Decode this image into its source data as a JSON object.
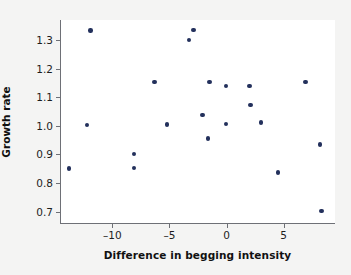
{
  "chart_data": {
    "type": "scatter",
    "title": "",
    "xlabel": "Difference in begging intensity",
    "ylabel": "Growth rate",
    "xlim": [
      -14.5,
      9.5
    ],
    "ylim": [
      0.66,
      1.37
    ],
    "xticks": [
      -10,
      -5,
      0,
      5
    ],
    "xtick_labels": [
      "–10",
      "–5",
      "0",
      "5"
    ],
    "yticks": [
      0.7,
      0.8,
      0.9,
      1.0,
      1.1,
      1.2,
      1.3
    ],
    "ytick_labels": [
      "0.7",
      "0.8",
      "0.9",
      "1.0",
      "1.1",
      "1.2",
      "1.3"
    ],
    "grid": false,
    "legend": null,
    "marker_color": "#23305c",
    "axis_color": "#6e7076",
    "background": "#ffffff",
    "page_background": "#f4f4f3",
    "points": [
      {
        "x": -13.8,
        "y": 0.85
      },
      {
        "x": -11.9,
        "y": 1.333
      },
      {
        "x": -12.2,
        "y": 1.003
      },
      {
        "x": -8.1,
        "y": 0.901
      },
      {
        "x": -8.1,
        "y": 0.853
      },
      {
        "x": -6.3,
        "y": 1.153
      },
      {
        "x": -5.2,
        "y": 1.004
      },
      {
        "x": -3.3,
        "y": 1.3
      },
      {
        "x": -2.9,
        "y": 1.335
      },
      {
        "x": -2.1,
        "y": 1.038
      },
      {
        "x": -1.5,
        "y": 1.153
      },
      {
        "x": -1.6,
        "y": 0.956
      },
      {
        "x": -0.05,
        "y": 1.139
      },
      {
        "x": -0.05,
        "y": 1.006
      },
      {
        "x": 2.0,
        "y": 1.139
      },
      {
        "x": 2.1,
        "y": 1.073
      },
      {
        "x": 3.0,
        "y": 1.012
      },
      {
        "x": 4.5,
        "y": 0.836
      },
      {
        "x": 6.9,
        "y": 1.153
      },
      {
        "x": 8.2,
        "y": 0.935
      },
      {
        "x": 8.3,
        "y": 0.703
      }
    ]
  }
}
